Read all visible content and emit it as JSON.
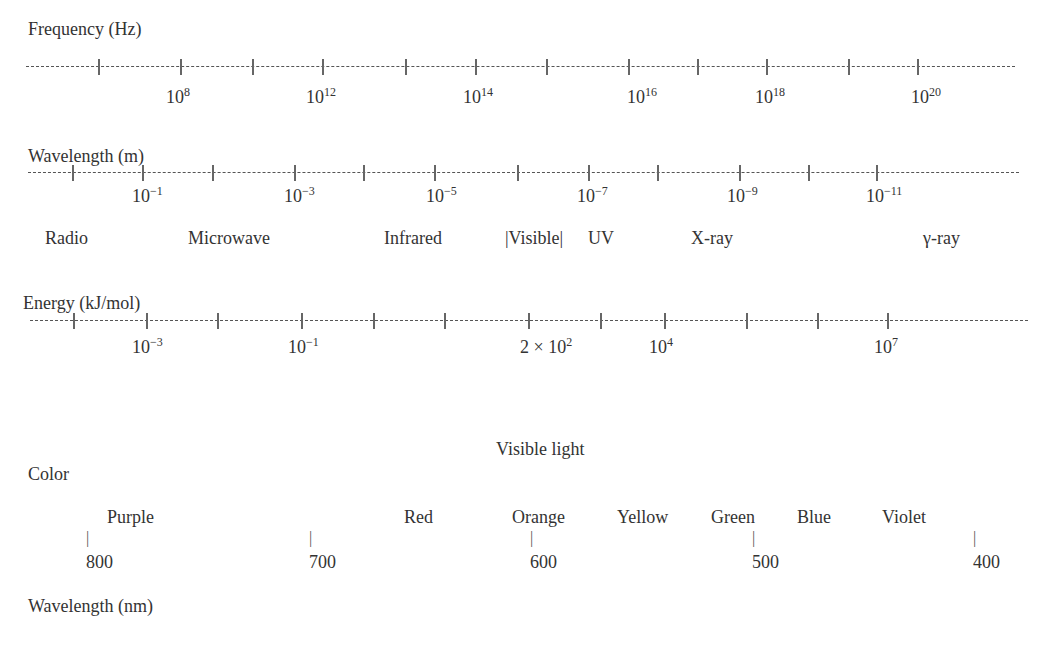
{
  "frequency": {
    "title": "Frequency (Hz)",
    "line": {
      "x1": 26,
      "x2": 1015,
      "y": 66
    },
    "ticks": [
      98,
      180,
      252,
      322,
      405,
      475,
      546,
      628,
      697,
      766,
      848,
      917
    ],
    "labels": [
      {
        "base": "10",
        "exp": "8",
        "x": 166
      },
      {
        "base": "10",
        "exp": "12",
        "x": 306
      },
      {
        "base": "10",
        "exp": "14",
        "x": 463
      },
      {
        "base": "10",
        "exp": "16",
        "x": 627
      },
      {
        "base": "10",
        "exp": "18",
        "x": 755
      },
      {
        "base": "10",
        "exp": "20",
        "x": 911
      }
    ]
  },
  "wavelength_m": {
    "title": "Wavelength (m)",
    "line": {
      "x1": 28,
      "x2": 1019,
      "y": 172
    },
    "ticks": [
      72,
      142,
      212,
      294,
      363,
      434,
      517,
      588,
      657,
      739,
      808,
      876
    ],
    "labels": [
      {
        "base": "10",
        "exp": "−1",
        "x": 132
      },
      {
        "base": "10",
        "exp": "−3",
        "x": 284
      },
      {
        "base": "10",
        "exp": "−5",
        "x": 426
      },
      {
        "base": "10",
        "exp": "−7",
        "x": 577
      },
      {
        "base": "10",
        "exp": "−9",
        "x": 727
      },
      {
        "base": "10",
        "exp": "−11",
        "x": 866
      }
    ]
  },
  "regions": [
    {
      "label": "Radio",
      "x": 45
    },
    {
      "label": "Microwave",
      "x": 188
    },
    {
      "label": "Infrared",
      "x": 384
    },
    {
      "label": "|Visible|",
      "x": 505
    },
    {
      "label": "UV",
      "x": 588
    },
    {
      "label": "X-ray",
      "x": 691
    },
    {
      "label": "γ-ray",
      "x": 923
    }
  ],
  "energy": {
    "title": "Energy (kJ/mol)",
    "line": {
      "x1": 30,
      "x2": 1028,
      "y": 320
    },
    "ticks": [
      73,
      146,
      217,
      301,
      373,
      444,
      528,
      600,
      664,
      746,
      817,
      887
    ],
    "labels": [
      {
        "base": "10",
        "exp": "−3",
        "x": 132
      },
      {
        "base": "10",
        "exp": "−1",
        "x": 288
      },
      {
        "base": "2 × 10",
        "exp": "2",
        "x": 520
      },
      {
        "base": "10",
        "exp": "4",
        "x": 649
      },
      {
        "base": "10",
        "exp": "7",
        "x": 874
      }
    ]
  },
  "visible": {
    "title": "Visible light",
    "color_label": "Color",
    "axis_label": "Wavelength (nm)",
    "colors": [
      {
        "label": "Purple",
        "x": 107
      },
      {
        "label": "Red",
        "x": 404
      },
      {
        "label": "Orange",
        "x": 512
      },
      {
        "label": "Yellow",
        "x": 617
      },
      {
        "label": "Green",
        "x": 711
      },
      {
        "label": "Blue",
        "x": 797
      },
      {
        "label": "Violet",
        "x": 882
      }
    ],
    "wavelengths": [
      {
        "value": "800",
        "x": 86
      },
      {
        "value": "700",
        "x": 309
      },
      {
        "value": "600",
        "x": 530
      },
      {
        "value": "500",
        "x": 752
      },
      {
        "value": "400",
        "x": 973
      }
    ]
  },
  "chart_data": {
    "type": "table",
    "scales": [
      {
        "name": "Frequency (Hz)",
        "tick_labels": [
          "10^8",
          "10^12",
          "10^14",
          "10^16",
          "10^18",
          "10^20"
        ]
      },
      {
        "name": "Wavelength (m)",
        "tick_labels": [
          "10^-1",
          "10^-3",
          "10^-5",
          "10^-7",
          "10^-9",
          "10^-11"
        ]
      },
      {
        "name": "Energy (kJ/mol)",
        "tick_labels": [
          "10^-3",
          "10^-1",
          "2 × 10^2",
          "10^4",
          "10^7"
        ]
      }
    ],
    "regions": [
      "Radio",
      "Microwave",
      "Infrared",
      "Visible",
      "UV",
      "X-ray",
      "γ-ray"
    ],
    "visible_light": {
      "colors": [
        "Purple",
        "Red",
        "Orange",
        "Yellow",
        "Green",
        "Blue",
        "Violet"
      ],
      "wavelength_nm_ticks": [
        800,
        700,
        600,
        500,
        400
      ]
    }
  }
}
